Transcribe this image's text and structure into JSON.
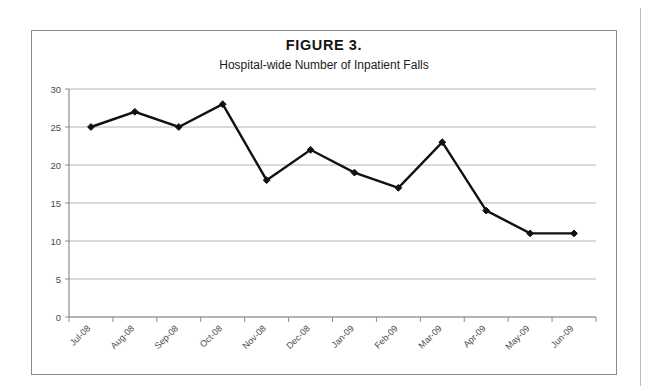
{
  "figure": {
    "title": "FIGURE 3.",
    "subtitle": "Hospital-wide Number of Inpatient Falls"
  },
  "chart_data": {
    "type": "line",
    "title": "FIGURE 3.",
    "subtitle": "Hospital-wide Number of Inpatient Falls",
    "xlabel": "",
    "ylabel": "",
    "categories": [
      "Jul-08",
      "Aug-08",
      "Sep-08",
      "Oct-08",
      "Nov-08",
      "Dec-08",
      "Jan-09",
      "Feb-09",
      "Mar-09",
      "Apr-09",
      "May-09",
      "Jun-09"
    ],
    "values": [
      25,
      27,
      25,
      28,
      18,
      22,
      19,
      17,
      23,
      14,
      11,
      11
    ],
    "ylim": [
      0,
      30
    ],
    "yticks": [
      0,
      5,
      10,
      15,
      20,
      25,
      30
    ],
    "ytick_labels": [
      "0",
      "5",
      "10",
      "15",
      "20",
      "25",
      "30"
    ],
    "grid": true,
    "grid_axis": "y",
    "legend": false,
    "marker": "diamond",
    "line_color": "#111111",
    "marker_color": "#111111",
    "gridline_color": "#b4b4b4",
    "xtick_rotation": 45
  }
}
